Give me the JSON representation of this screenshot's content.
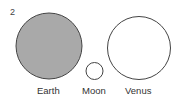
{
  "figure": {
    "number": "2",
    "bodies": [
      {
        "name": "Earth",
        "fill": "#a9a9a9",
        "cx": 49,
        "cy": 46,
        "r": 33
      },
      {
        "name": "Moon",
        "fill": "#ffffff",
        "cx": 94.5,
        "cy": 71,
        "r": 8.5
      },
      {
        "name": "Venus",
        "fill": "#ffffff",
        "cx": 139,
        "cy": 48,
        "r": 31.5
      }
    ],
    "stroke": "#444444"
  }
}
